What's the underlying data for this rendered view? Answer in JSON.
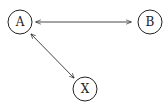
{
  "diagram": {
    "type": "node-link graph",
    "nodes": [
      {
        "id": "A",
        "label": "A",
        "cx": 20,
        "cy": 22,
        "r": 12
      },
      {
        "id": "B",
        "label": "B",
        "cx": 150,
        "cy": 22,
        "r": 12
      },
      {
        "id": "X",
        "label": "X",
        "cx": 85,
        "cy": 89,
        "r": 12
      }
    ],
    "edges": [
      {
        "from": "A",
        "to": "B",
        "direction": "bidirectional"
      },
      {
        "from": "A",
        "to": "X",
        "direction": "bidirectional"
      }
    ],
    "colors": {
      "stroke": "#222222",
      "background": "#ffffff"
    }
  }
}
